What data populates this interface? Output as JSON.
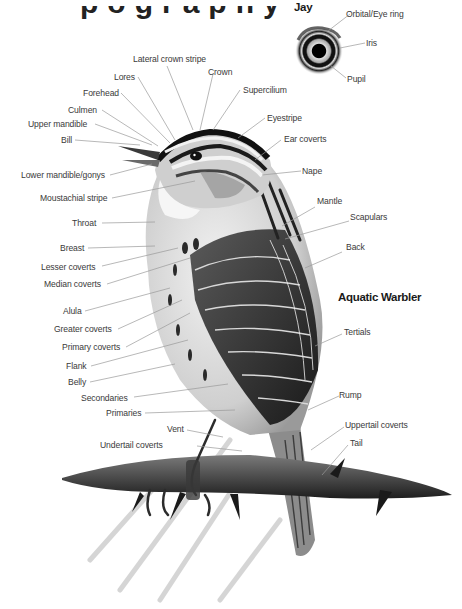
{
  "title_fragment": "pography",
  "headings": {
    "jay": "Jay",
    "aquatic_warbler": "Aquatic Warbler"
  },
  "eye_labels": {
    "orbital": "Orbital/Eye ring",
    "iris": "Iris",
    "pupil": "Pupil"
  },
  "top_labels": {
    "lateral_crown_stripe": "Lateral crown stripe",
    "crown": "Crown",
    "lores": "Lores",
    "forehead": "Forehead",
    "supercilium": "Supercilium",
    "culmen": "Culmen",
    "upper_mandible": "Upper mandible",
    "eyestripe": "Eyestripe",
    "bill": "Bill",
    "ear_coverts": "Ear coverts"
  },
  "left_labels": {
    "lower_mandible": "Lower mandible/gonys",
    "moustachial_stripe": "Moustachial stripe",
    "throat": "Throat",
    "breast": "Breast",
    "lesser_coverts": "Lesser coverts",
    "median_coverts": "Median coverts",
    "alula": "Alula",
    "greater_coverts": "Greater coverts",
    "primary_coverts": "Primary coverts",
    "flank": "Flank",
    "belly": "Belly",
    "secondaries": "Secondaries",
    "primaries": "Primaries",
    "vent": "Vent",
    "undertail_coverts": "Undertail coverts"
  },
  "right_labels": {
    "nape": "Nape",
    "mantle": "Mantle",
    "scapulars": "Scapulars",
    "back": "Back",
    "tertials": "Tertials",
    "rump": "Rump",
    "uppertail_coverts": "Uppertail coverts",
    "tail": "Tail"
  },
  "colors": {
    "label_text": "#3a3a3a",
    "leader_line": "#9a9a9a",
    "heading_text": "#1a1a1a"
  }
}
